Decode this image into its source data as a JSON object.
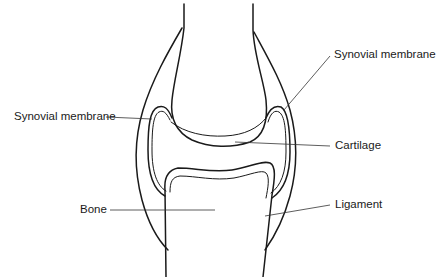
{
  "diagram": {
    "type": "anatomical-line-drawing",
    "stroke_color": "#1a1a1a",
    "background": "#ffffff"
  },
  "labels": {
    "synovial_membrane_left": "Synovial membrane",
    "synovial_membrane_right": "Synovial membrane",
    "cartilage": "Cartilage",
    "bone": "Bone",
    "ligament": "Ligament"
  }
}
